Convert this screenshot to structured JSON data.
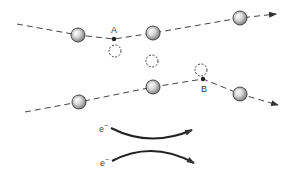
{
  "diagram": {
    "labels": {
      "point_a": "A",
      "point_b": "B",
      "electron_1": "e",
      "electron_1_sup": "−",
      "electron_2": "e",
      "electron_2_sup": "−"
    },
    "colors": {
      "line": "#444444",
      "atom_fill_light": "#f2f2f2",
      "atom_fill_dark": "#8a8a8a",
      "background": "#ffffff"
    },
    "paths": [
      {
        "name": "upper-electron-path",
        "style": "dashed",
        "scatter_point": "A"
      },
      {
        "name": "lower-electron-path",
        "style": "dashed",
        "scatter_point": "B"
      }
    ],
    "elements": {
      "atoms": 6,
      "vacancies": 3,
      "scatter_points": 2,
      "electron_arrows": 2
    }
  }
}
